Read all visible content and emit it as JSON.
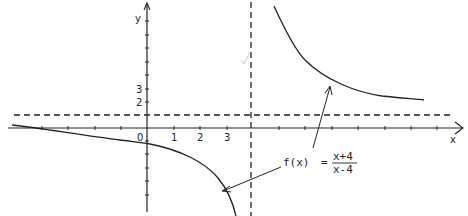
{
  "diagram": {
    "type": "function-graph",
    "function": {
      "name": "f(x)",
      "equals": "=",
      "numerator": "x+4",
      "denominator": "x-4"
    },
    "axes": {
      "x_label": "x",
      "y_label": "y",
      "origin_label": "0",
      "x_ticks": [
        "1",
        "2",
        "3"
      ],
      "y_ticks": [
        "2",
        "3"
      ]
    },
    "asymptotes": {
      "vertical": "x = 4",
      "horizontal": "y = 1"
    },
    "colors": {
      "ink": "#222222",
      "background": "#ffffff",
      "checkmark": "#c8c8c8"
    }
  }
}
